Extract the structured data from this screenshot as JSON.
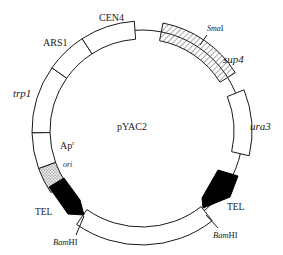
{
  "diagram": {
    "title": "pYAC2",
    "center": [
      142,
      131
    ],
    "backbone_radius": 101,
    "block_inner_radius": 92,
    "block_outer_radius": 110,
    "colors": {
      "stroke": "#1a1a1a",
      "fill": "#ffffff",
      "tel": "#000000",
      "ori": "#c8c8c8",
      "hatch": "#555555"
    },
    "segments": [
      {
        "id": "cen4",
        "label": "CEN4",
        "start": -33,
        "end": -4,
        "fill": "white"
      },
      {
        "id": "ars1",
        "label": "ARS1",
        "start": -55,
        "end": -33,
        "fill": "white"
      },
      {
        "id": "trp1",
        "label": "trp1",
        "start": -91,
        "end": -55,
        "fill": "white"
      },
      {
        "id": "apr",
        "label": "Apr",
        "start": -110,
        "end": -91,
        "fill": "white"
      },
      {
        "id": "ori",
        "label": "ori",
        "start": -124,
        "end": -110,
        "fill": "stipple"
      },
      {
        "id": "sup4",
        "label": "sup4",
        "start": 11,
        "end": 58,
        "fill": "hatch"
      },
      {
        "id": "ura3",
        "label": "ura3",
        "start": 68,
        "end": 103,
        "fill": "white"
      },
      {
        "id": "stuffer",
        "label": "",
        "start": 142,
        "end": 215,
        "fill": "white",
        "offset": 4
      }
    ],
    "labels": {
      "cen4": "CEN4",
      "ars1": "ARS1",
      "trp1": "trp1",
      "ap": "Ap",
      "ap_sup": "r",
      "ori": "ori",
      "smai": "Sma",
      "smai_suffix": "I",
      "sup4": "sup4",
      "ura3": "ura3",
      "tel_left": "TEL",
      "tel_right": "TEL",
      "bamhi_left": "Bam",
      "bamhi_left_suffix": "HI",
      "bamhi_right": "Bam",
      "bamhi_right_suffix": "HI",
      "center": "pYAC2"
    }
  }
}
